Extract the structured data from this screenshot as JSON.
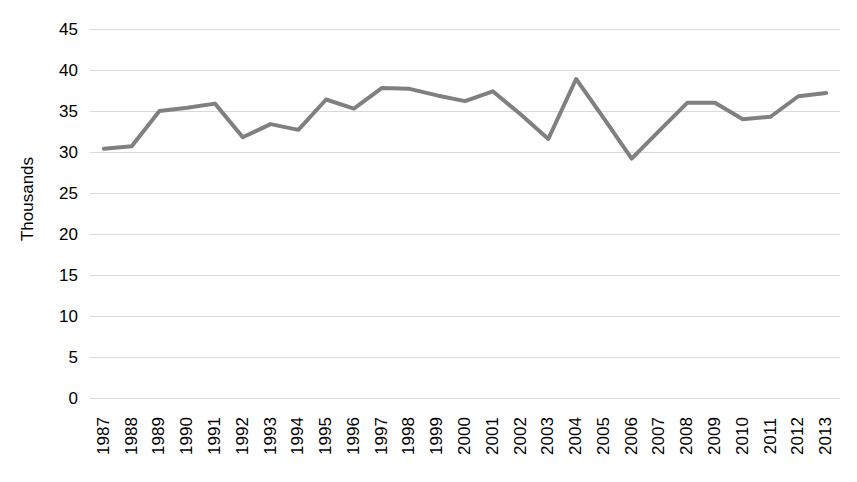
{
  "chart_data": {
    "type": "line",
    "title": "",
    "xlabel": "",
    "ylabel": "Thousands",
    "categories": [
      "1987",
      "1988",
      "1989",
      "1990",
      "1991",
      "1992",
      "1993",
      "1994",
      "1995",
      "1996",
      "1997",
      "1998",
      "1999",
      "2000",
      "2001",
      "2002",
      "2003",
      "2004",
      "2005",
      "2006",
      "2007",
      "2008",
      "2009",
      "2010",
      "2011",
      "2012",
      "2013"
    ],
    "values": [
      30.4,
      30.7,
      35.0,
      35.4,
      35.9,
      31.8,
      33.4,
      32.7,
      36.4,
      35.3,
      37.8,
      37.7,
      36.9,
      36.2,
      37.4,
      34.6,
      31.6,
      38.9,
      34.1,
      29.2,
      32.6,
      36.0,
      36.0,
      34.0,
      34.3,
      36.8,
      37.2
    ],
    "ylim": [
      0,
      45
    ],
    "ytick_step": 5,
    "yticks": [
      "45",
      "40",
      "35",
      "30",
      "25",
      "20",
      "15",
      "10",
      "5",
      "0"
    ],
    "grid": true,
    "legend": false,
    "legend_position": "none",
    "series_color": "#808080",
    "gridline_color": "#d9d9d9",
    "text_color": "#000000",
    "xtick_rotation": -90
  }
}
